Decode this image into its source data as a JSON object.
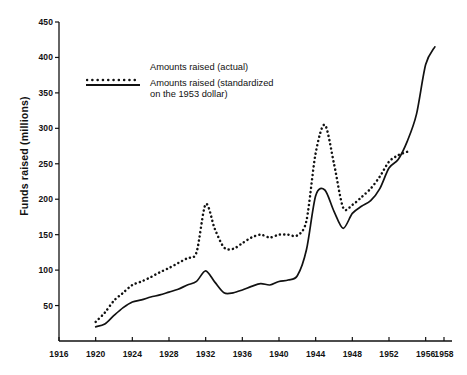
{
  "chart_data": {
    "type": "line",
    "title": "",
    "xlabel": "",
    "ylabel": "Funds raised (millions)",
    "xlim": [
      1916,
      1958
    ],
    "ylim": [
      0,
      450
    ],
    "grid": false,
    "legend_position": "upper-left",
    "xticks": [
      "1916",
      "1920",
      "1924",
      "1928",
      "1932",
      "1936",
      "1940",
      "1944",
      "1948",
      "1952",
      "1956",
      "1958"
    ],
    "xtick_values": [
      1916,
      1920,
      1924,
      1928,
      1932,
      1936,
      1940,
      1944,
      1948,
      1952,
      1956,
      1958
    ],
    "yticks": [
      "50",
      "100",
      "150",
      "200",
      "250",
      "300",
      "350",
      "400",
      "450"
    ],
    "ytick_values": [
      50,
      100,
      150,
      200,
      250,
      300,
      350,
      400,
      450
    ],
    "series": [
      {
        "name": "Amounts raised (actual)",
        "style": "dotted",
        "color": "#111111",
        "x": [
          1920,
          1921,
          1922,
          1923,
          1924,
          1925,
          1926,
          1927,
          1928,
          1929,
          1930,
          1931,
          1932,
          1933,
          1934,
          1935,
          1936,
          1937,
          1938,
          1939,
          1940,
          1941,
          1942,
          1943,
          1944,
          1945,
          1946,
          1947,
          1948,
          1949,
          1950,
          1951,
          1952,
          1953,
          1954
        ],
        "values": [
          27,
          40,
          57,
          68,
          79,
          84,
          90,
          97,
          103,
          110,
          117,
          125,
          193,
          158,
          132,
          130,
          138,
          146,
          150,
          146,
          150,
          150,
          149,
          170,
          265,
          305,
          250,
          188,
          192,
          203,
          215,
          232,
          253,
          262,
          267
        ]
      },
      {
        "name": "Amounts raised (standardized\non the 1953 dollar)",
        "style": "solid",
        "color": "#111111",
        "x": [
          1920,
          1921,
          1922,
          1923,
          1924,
          1925,
          1926,
          1927,
          1928,
          1929,
          1930,
          1931,
          1932,
          1933,
          1934,
          1935,
          1936,
          1937,
          1938,
          1939,
          1940,
          1941,
          1942,
          1943,
          1944,
          1945,
          1946,
          1947,
          1948,
          1949,
          1950,
          1951,
          1952,
          1953,
          1954,
          1955,
          1956,
          1957
        ],
        "values": [
          20,
          24,
          36,
          47,
          55,
          58,
          62,
          65,
          69,
          73,
          79,
          84,
          99,
          83,
          68,
          68,
          72,
          77,
          81,
          79,
          84,
          86,
          92,
          129,
          205,
          213,
          183,
          159,
          180,
          190,
          198,
          215,
          244,
          256,
          282,
          320,
          390,
          415
        ]
      }
    ]
  },
  "legend": {
    "items": [
      {
        "label": "Amounts raised (actual)",
        "style": "dotted"
      },
      {
        "label": "Amounts raised (standardized\non the 1953 dollar)",
        "style": "solid"
      }
    ]
  },
  "axes": {
    "y_axis_title": "Funds raised (millions)"
  }
}
